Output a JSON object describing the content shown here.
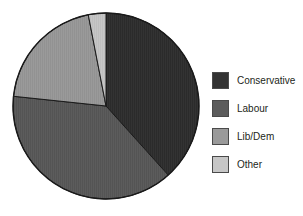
{
  "chart_data": {
    "type": "pie",
    "title": "",
    "categories": [
      "Conservative",
      "Labour",
      "Lib/Dem",
      "Other"
    ],
    "values": [
      38.3,
      38.3,
      20.3,
      3.1
    ],
    "units": "percent",
    "start_angle_deg": 0,
    "direction": "clockwise",
    "slice_angles_deg": [
      138,
      138,
      73,
      11
    ],
    "slice_boundaries_deg": [
      0,
      138,
      276,
      349,
      360
    ],
    "colors": [
      "#333333",
      "#5c5c5c",
      "#9a9a9a",
      "#c6c6c6"
    ],
    "legend_position": "right",
    "grid": false,
    "xlabel": "",
    "ylabel": "",
    "series": [
      {
        "name": "Vote share",
        "points": [
          {
            "label": "Conservative",
            "value": 38.3,
            "color": "#333333"
          },
          {
            "label": "Labour",
            "value": 38.3,
            "color": "#5c5c5c"
          },
          {
            "label": "Lib/Dem",
            "value": 20.3,
            "color": "#9a9a9a"
          },
          {
            "label": "Other",
            "value": 3.1,
            "color": "#c6c6c6"
          }
        ]
      }
    ]
  },
  "pie": {
    "center_x": 106,
    "center_y": 106,
    "radius": 93,
    "outline_color": "#1a1a1a"
  },
  "legend": {
    "items": [
      {
        "label": "Conservative",
        "color": "#333333"
      },
      {
        "label": "Labour",
        "color": "#5c5c5c"
      },
      {
        "label": "Lib/Dem",
        "color": "#9a9a9a"
      },
      {
        "label": "Other",
        "color": "#c6c6c6"
      }
    ]
  }
}
